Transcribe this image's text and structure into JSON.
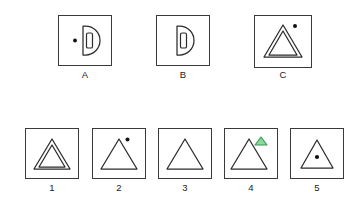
{
  "puzzle": {
    "type": "visual-analogy-matrix",
    "canvas": {
      "width": 353,
      "height": 201,
      "background": "#ffffff"
    },
    "style": {
      "frame_stroke": "#3a3a3a",
      "figure_stroke": "#2b2b2b",
      "dot_fill": "#111111",
      "accent_green_stroke": "#2e9e4f",
      "accent_green_fill": "#8fd6a0",
      "label_color": "#1a1a1a"
    },
    "prompt_row": {
      "name": "prompt-row",
      "cells": [
        {
          "label": "A",
          "box": {
            "x": 58,
            "y": 15,
            "w": 54,
            "h": 51
          },
          "figure": "d-shape-with-inner-bar-and-left-dot",
          "elements": [
            "half-disc-d-outline",
            "inner-vertical-rounded-bar",
            "dot-left-outside"
          ]
        },
        {
          "label": "B",
          "box": {
            "x": 156,
            "y": 15,
            "w": 54,
            "h": 51
          },
          "figure": "d-shape-with-inner-bar",
          "elements": [
            "half-disc-d-outline",
            "inner-vertical-rounded-bar"
          ]
        },
        {
          "label": "C",
          "box": {
            "x": 254,
            "y": 15,
            "w": 58,
            "h": 53
          },
          "figure": "double-triangle-with-dot-upper-right",
          "elements": [
            "outer-triangle-outline",
            "inner-triangle-outline",
            "dot-upper-right"
          ]
        }
      ]
    },
    "answer_row": {
      "name": "answer-options-row",
      "cells": [
        {
          "label": "1",
          "box": {
            "x": 25,
            "y": 128,
            "w": 54,
            "h": 51
          },
          "figure": "double-triangle",
          "elements": [
            "outer-triangle-outline",
            "inner-triangle-outline"
          ]
        },
        {
          "label": "2",
          "box": {
            "x": 92,
            "y": 128,
            "w": 54,
            "h": 51
          },
          "figure": "triangle-with-dot-upper-right",
          "elements": [
            "triangle-outline",
            "dot-upper-right"
          ]
        },
        {
          "label": "3",
          "box": {
            "x": 158,
            "y": 128,
            "w": 54,
            "h": 51
          },
          "figure": "plain-triangle",
          "elements": [
            "triangle-outline"
          ]
        },
        {
          "label": "4",
          "box": {
            "x": 224,
            "y": 128,
            "w": 54,
            "h": 51
          },
          "figure": "triangle-with-small-green-triangle-upper-right",
          "elements": [
            "triangle-outline",
            "small-green-triangle-upper-right"
          ]
        },
        {
          "label": "5",
          "box": {
            "x": 290,
            "y": 128,
            "w": 54,
            "h": 51
          },
          "figure": "triangle-with-inner-dot",
          "elements": [
            "triangle-outline",
            "dot-inside-center"
          ]
        }
      ]
    }
  }
}
